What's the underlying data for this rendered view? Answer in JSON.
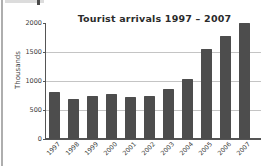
{
  "chart_data": {
    "type": "bar",
    "title": "Tourist arrivals 1997 – 2007",
    "xlabel": "",
    "ylabel": "Thousands",
    "categories": [
      "1997",
      "1998",
      "1999",
      "2000",
      "2001",
      "2002",
      "2003",
      "2004",
      "2005",
      "2006",
      "2007"
    ],
    "values": [
      800,
      680,
      745,
      780,
      725,
      730,
      860,
      1030,
      1550,
      1780,
      2000
    ],
    "yticks": [
      0,
      500,
      1000,
      1500,
      2000
    ],
    "gridlines": [
      500,
      1000,
      1500
    ],
    "ylim": [
      0,
      2000
    ],
    "legend": "none",
    "bar_color": "#4d4d4d",
    "grid_color": "#c4c4c4",
    "axis_color": "#555555",
    "text_color": "#3a3a3a"
  }
}
